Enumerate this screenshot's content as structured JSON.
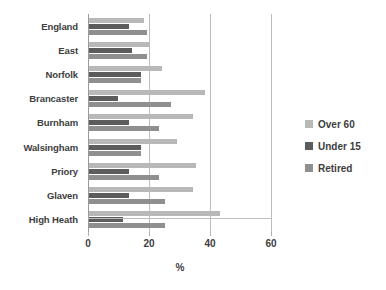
{
  "chart_data": {
    "type": "bar",
    "orientation": "horizontal",
    "title": "",
    "xlabel": "%",
    "ylabel": "",
    "xlim": [
      0,
      60
    ],
    "xticks": [
      0,
      20,
      40,
      60
    ],
    "grid": "vertical",
    "legend_position": "right",
    "categories": [
      "England",
      "East",
      "Norfolk",
      "Brancaster",
      "Burnham",
      "Walsingham",
      "Priory",
      "Glaven",
      "High Heath"
    ],
    "series": [
      {
        "name": "Over 60",
        "color": "#b8b8b8",
        "values": [
          18,
          20,
          24,
          38,
          34,
          29,
          35,
          34,
          43
        ]
      },
      {
        "name": "Under 15",
        "color": "#5c5c5c",
        "values": [
          13,
          14,
          17,
          9.5,
          13,
          17,
          13,
          13,
          11
        ]
      },
      {
        "name": "Retired",
        "color": "#8f8f8f",
        "values": [
          19,
          19,
          17,
          27,
          23,
          17,
          23,
          25,
          25
        ]
      }
    ]
  },
  "axis": {
    "x_tick_labels": [
      "0",
      "20",
      "40",
      "60"
    ],
    "x_title": "%"
  }
}
